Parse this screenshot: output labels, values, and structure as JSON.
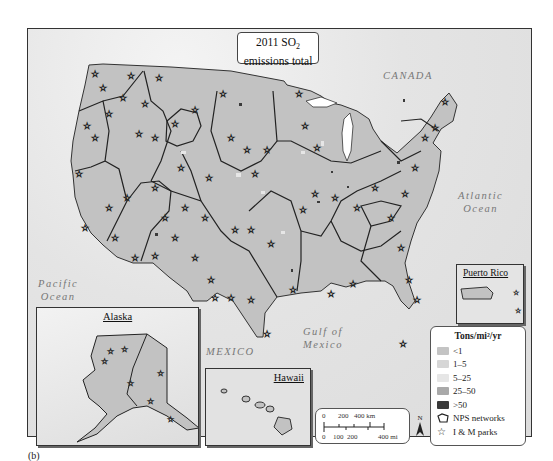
{
  "figure": {
    "panel_label": "(b)",
    "title_line1": "2011 SO",
    "title_subscript": "2",
    "title_line2": "emissions total"
  },
  "geo_labels": {
    "canada": "CANADA",
    "pacific": "Pacific\nOcean",
    "atlantic": "Atlantic\nOcean",
    "gulf": "Gulf of\nMexico",
    "mexico": "MEXICO"
  },
  "insets": {
    "alaska": "Alaska",
    "hawaii": "Hawaii",
    "puerto_rico": "Puerto Rico"
  },
  "legend": {
    "title": "Tons/mi²/yr",
    "classes": [
      {
        "label": "<1",
        "color": "#c4c4c4"
      },
      {
        "label": "1–5",
        "color": "#d6d6d6"
      },
      {
        "label": "5–25",
        "color": "#e6e6e6"
      },
      {
        "label": "25–50",
        "color": "#a9a9a9"
      },
      {
        "label": ">50",
        "color": "#3a3a3a"
      }
    ],
    "nps_networks": "NPS networks",
    "im_parks": "I & M parks"
  },
  "scale_bar": {
    "km_labels": [
      "0",
      "200",
      "400 km"
    ],
    "mi_labels": [
      "0",
      "100",
      "200",
      "400 mi"
    ]
  },
  "north_arrow": "N",
  "colors": {
    "land": "#c2c2c2",
    "boundary": "#222222",
    "ocean_light": "#e4e4e4"
  }
}
